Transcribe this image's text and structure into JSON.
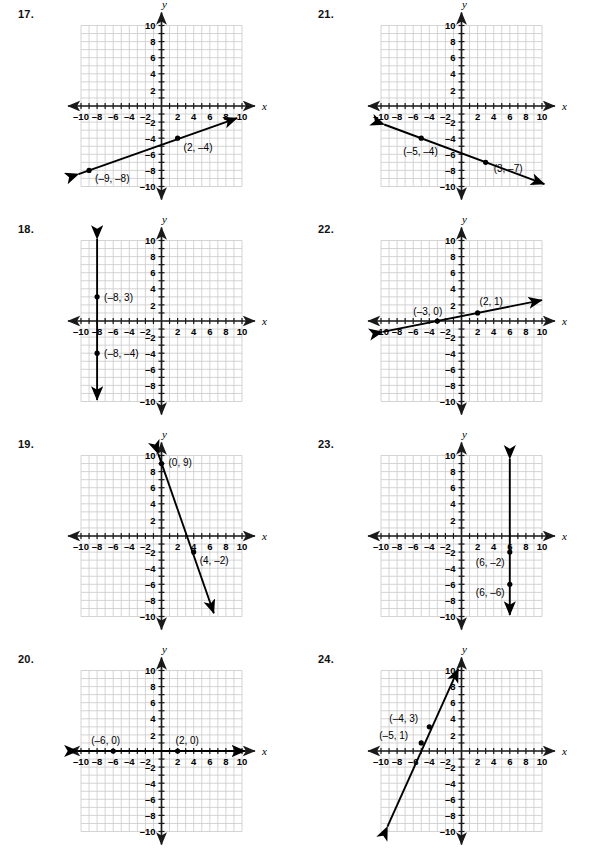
{
  "page": {
    "background_color": "#ffffff",
    "grid_color": "#c9c9c9",
    "axis_color": "#1a1a1a",
    "line_color": "#000000",
    "cut_off_top_text": ""
  },
  "axis": {
    "x_label": "x",
    "y_label": "y",
    "x_ticks": [
      "-10",
      "-8",
      "-6",
      "-4",
      "-2",
      "2",
      "4",
      "6",
      "8",
      "10"
    ],
    "y_ticks": [
      "10",
      "8",
      "6",
      "4",
      "2",
      "-2",
      "-4",
      "-6",
      "-8",
      "-10"
    ],
    "x_min": -10,
    "x_max": 10,
    "y_min": -10,
    "y_max": 10,
    "grid": true
  },
  "problems": [
    {
      "number": "17.",
      "id": "problem-17",
      "column": "left",
      "row": 0,
      "chart_data": {
        "type": "line",
        "title": "17.",
        "xlabel": "x",
        "ylabel": "y",
        "xlim": [
          -10,
          10
        ],
        "ylim": [
          -10,
          10
        ],
        "grid": true,
        "points": [
          {
            "x": 2,
            "y": -4,
            "label": "(2, –4)",
            "label_dx": 6,
            "label_dy": 13
          },
          {
            "x": -9,
            "y": -8,
            "label": "(–9, –8)",
            "label_dx": 6,
            "label_dy": 12
          }
        ],
        "segment": {
          "x1": -10.3,
          "y1": -8.45,
          "x2": 9.4,
          "y2": -1.5
        },
        "arrows": "both",
        "slope": 0.3636,
        "intercept": -4.73
      }
    },
    {
      "number": "21.",
      "id": "problem-21",
      "column": "right",
      "row": 0,
      "chart_data": {
        "type": "line",
        "title": "21.",
        "xlabel": "x",
        "ylabel": "y",
        "xlim": [
          -10,
          10
        ],
        "ylim": [
          -10,
          10
        ],
        "grid": true,
        "points": [
          {
            "x": -5,
            "y": -4,
            "label": "(–5, –4)",
            "label_dx": -18,
            "label_dy": 17
          },
          {
            "x": 3,
            "y": -7,
            "label": "(3, –7)",
            "label_dx": 8,
            "label_dy": 10
          }
        ],
        "segment": {
          "x1": -9.6,
          "y1": -2.3,
          "x2": 10.3,
          "y2": -9.7
        },
        "arrows": "both",
        "slope": -0.375,
        "intercept": -5.875
      }
    },
    {
      "number": "18.",
      "id": "problem-18",
      "column": "left",
      "row": 1,
      "chart_data": {
        "type": "line",
        "title": "18.",
        "xlabel": "x",
        "ylabel": "y",
        "xlim": [
          -10,
          10
        ],
        "ylim": [
          -10,
          10
        ],
        "grid": true,
        "points": [
          {
            "x": -8,
            "y": 3,
            "label": "(–8, 3)",
            "label_dx": 7,
            "label_dy": 4
          },
          {
            "x": -8,
            "y": -4,
            "label": "(–8, –4)",
            "label_dx": 7,
            "label_dy": 4
          }
        ],
        "segment": {
          "x1": -8,
          "y1": 10.2,
          "x2": -8,
          "y2": -9.8
        },
        "arrows": "both",
        "orientation": "vertical",
        "equation": "x = –8"
      }
    },
    {
      "number": "22.",
      "id": "problem-22",
      "column": "right",
      "row": 1,
      "chart_data": {
        "type": "line",
        "title": "22.",
        "xlabel": "x",
        "ylabel": "y",
        "xlim": [
          -10,
          10
        ],
        "ylim": [
          -10,
          10
        ],
        "grid": true,
        "points": [
          {
            "x": -3,
            "y": 0,
            "label": "(–3, 0)",
            "label_dx": -24,
            "label_dy": -6
          },
          {
            "x": 2,
            "y": 1,
            "label": "(2, 1)",
            "label_dx": 2,
            "label_dy": -8
          }
        ],
        "segment": {
          "x1": -9.8,
          "y1": -1.35,
          "x2": 10.0,
          "y2": 2.6
        },
        "arrows": "both",
        "slope": 0.2,
        "intercept": 0.6
      }
    },
    {
      "number": "19.",
      "id": "problem-19",
      "column": "left",
      "row": 2,
      "chart_data": {
        "type": "line",
        "title": "19.",
        "xlabel": "x",
        "ylabel": "y",
        "xlim": [
          -10,
          10
        ],
        "ylim": [
          -10,
          10
        ],
        "grid": true,
        "points": [
          {
            "x": 0,
            "y": 9,
            "label": "(0, 9)",
            "label_dx": 7,
            "label_dy": 2
          },
          {
            "x": 4,
            "y": -2,
            "label": "(4, –2)",
            "label_dx": 6,
            "label_dy": 12
          }
        ],
        "segment": {
          "x1": -0.4,
          "y1": 10.2,
          "x2": 6.5,
          "y2": -9.6
        },
        "arrows": "both",
        "slope": -2.75,
        "intercept": 9
      }
    },
    {
      "number": "23.",
      "id": "problem-23",
      "column": "right",
      "row": 2,
      "chart_data": {
        "type": "line",
        "title": "23.",
        "xlabel": "x",
        "ylabel": "y",
        "xlim": [
          -10,
          10
        ],
        "ylim": [
          -10,
          10
        ],
        "grid": true,
        "points": [
          {
            "x": 6,
            "y": -2,
            "label": "(6, –2)",
            "label_dx": -34,
            "label_dy": 14
          },
          {
            "x": 6,
            "y": -6,
            "label": "(6, –6)",
            "label_dx": -34,
            "label_dy": 12
          }
        ],
        "segment": {
          "x1": 6,
          "y1": 9.6,
          "x2": 6,
          "y2": -9.8
        },
        "arrows": "both",
        "orientation": "vertical",
        "equation": "x = 6"
      }
    },
    {
      "number": "20.",
      "id": "problem-20",
      "column": "left",
      "row": 3,
      "chart_data": {
        "type": "line",
        "title": "20.",
        "xlabel": "x",
        "ylabel": "y",
        "xlim": [
          -10,
          10
        ],
        "ylim": [
          -10,
          10
        ],
        "grid": true,
        "points": [
          {
            "x": -6,
            "y": 0,
            "label": "(–6, 0)",
            "label_dx": -22,
            "label_dy": -7
          },
          {
            "x": 2,
            "y": 0,
            "label": "(2, 0)",
            "label_dx": -2,
            "label_dy": -7
          }
        ],
        "segment": {
          "x1": -10.4,
          "y1": 0,
          "x2": 10.4,
          "y2": 0
        },
        "arrows": "both",
        "orientation": "horizontal",
        "equation": "y = 0"
      }
    },
    {
      "number": "24.",
      "id": "problem-24",
      "column": "right",
      "row": 3,
      "chart_data": {
        "type": "line",
        "title": "24.",
        "xlabel": "x",
        "ylabel": "y",
        "xlim": [
          -10,
          10
        ],
        "ylim": [
          -10,
          10
        ],
        "grid": true,
        "points": [
          {
            "x": -4,
            "y": 3,
            "label": "(–4, 3)",
            "label_dx": -40,
            "label_dy": -5
          },
          {
            "x": -5,
            "y": 1,
            "label": "(–5, 1)",
            "label_dx": -42,
            "label_dy": -4
          }
        ],
        "segment": {
          "x1": -9.2,
          "y1": -9.4,
          "x2": -0.4,
          "y2": 10.2
        },
        "arrows": "both",
        "slope": 2.0,
        "intercept": 11
      }
    }
  ]
}
